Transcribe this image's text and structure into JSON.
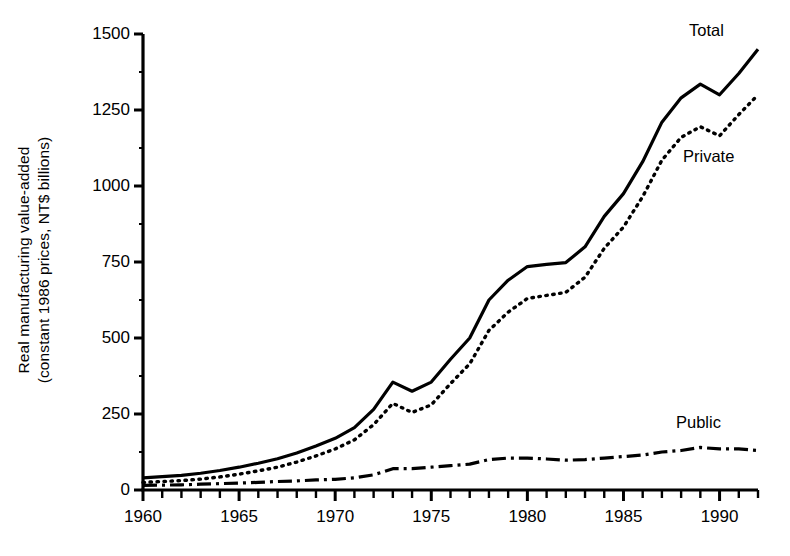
{
  "chart_data": {
    "type": "line",
    "title": "",
    "xlabel": "",
    "ylabel": "Real manufacturing value-added (constant 1986 prices, NT$ billions)",
    "ylabel_line1": "Real manufacturing value-added",
    "ylabel_line2": "(constant 1986 prices, NT$ billions)",
    "xlim": [
      1960,
      1992
    ],
    "ylim": [
      0,
      1500
    ],
    "grid": false,
    "legend_position": "inline-right",
    "y_ticks": [
      0,
      250,
      500,
      750,
      1000,
      1250,
      1500
    ],
    "y_tick_labels": [
      "0",
      "250",
      "500",
      "750",
      "1000",
      "1250",
      "1500"
    ],
    "x_ticks": [
      1960,
      1965,
      1970,
      1975,
      1980,
      1985,
      1990
    ],
    "x_tick_labels": [
      "1960",
      "1965",
      "1970",
      "1975",
      "1980",
      "1985",
      "1990"
    ],
    "x_minor_tick_interval": 1,
    "x": [
      1960,
      1961,
      1962,
      1963,
      1964,
      1965,
      1966,
      1967,
      1968,
      1969,
      1970,
      1971,
      1972,
      1973,
      1974,
      1975,
      1976,
      1977,
      1978,
      1979,
      1980,
      1981,
      1982,
      1983,
      1984,
      1985,
      1986,
      1987,
      1988,
      1989,
      1990,
      1991,
      1992
    ],
    "series": [
      {
        "name": "Total",
        "linestyle": "solid",
        "color": "#000000",
        "values": [
          40,
          44,
          48,
          55,
          64,
          75,
          88,
          103,
          122,
          145,
          170,
          205,
          265,
          355,
          325,
          355,
          430,
          500,
          625,
          690,
          735,
          742,
          748,
          800,
          900,
          975,
          1080,
          1210,
          1290,
          1335,
          1300,
          1370,
          1450
        ]
      },
      {
        "name": "Private",
        "linestyle": "dotted",
        "color": "#000000",
        "values": [
          25,
          28,
          31,
          36,
          43,
          52,
          63,
          75,
          92,
          112,
          135,
          165,
          215,
          285,
          255,
          280,
          350,
          415,
          525,
          585,
          630,
          640,
          650,
          700,
          795,
          865,
          965,
          1085,
          1160,
          1195,
          1165,
          1235,
          1300
        ]
      },
      {
        "name": "Public",
        "linestyle": "dashdot",
        "color": "#000000",
        "values": [
          15,
          16,
          17,
          19,
          21,
          23,
          25,
          28,
          30,
          33,
          35,
          40,
          50,
          70,
          70,
          75,
          80,
          85,
          100,
          105,
          105,
          102,
          98,
          100,
          105,
          110,
          115,
          125,
          130,
          140,
          135,
          135,
          130
        ]
      }
    ],
    "series_labels": [
      {
        "name": "Total",
        "text": "Total"
      },
      {
        "name": "Private",
        "text": "Private"
      },
      {
        "name": "Public",
        "text": "Public"
      }
    ]
  }
}
